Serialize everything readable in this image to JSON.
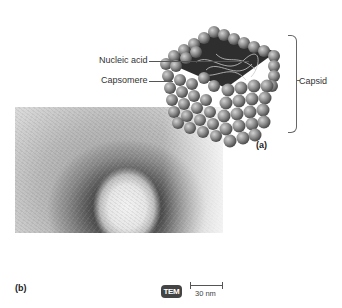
{
  "figure": {
    "panel_a": {
      "label": "(a)",
      "callouts": {
        "nucleic_acid": "Nucleic acid",
        "capsomere": "Capsomere",
        "capsid": "Capsid"
      }
    },
    "panel_b": {
      "label": "(b)",
      "microscopy_badge": "TEM",
      "scale_bar": "30 nm"
    }
  }
}
